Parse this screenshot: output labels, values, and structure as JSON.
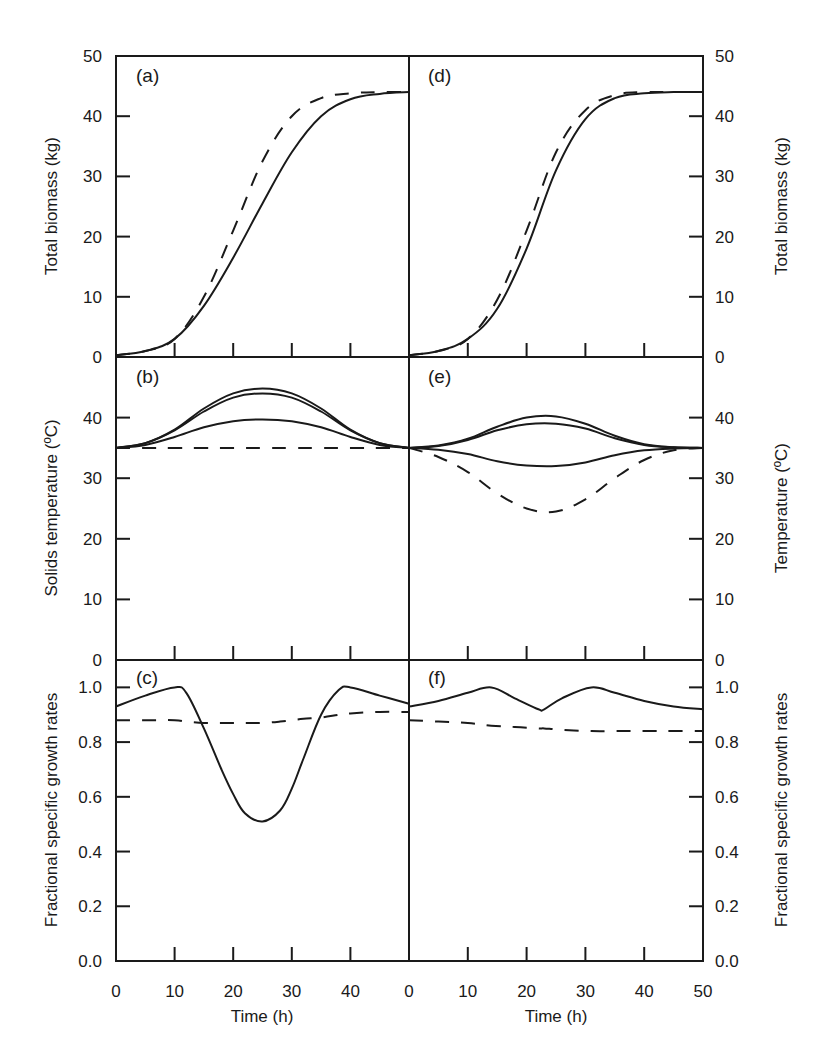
{
  "figure": {
    "x_axis_title": "Time (h)",
    "left_column": {
      "x_tick_labels": [
        "0",
        "10",
        "20",
        "30",
        "40"
      ]
    },
    "right_column": {
      "x_tick_labels": [
        "0",
        "10",
        "20",
        "30",
        "40",
        "50"
      ]
    }
  },
  "chart_data": [
    {
      "panel": "(a)",
      "type": "line",
      "ylabel": "Total biomass (kg)",
      "xlabel": "Time (h)",
      "xlim": [
        0,
        50
      ],
      "ylim": [
        0,
        50
      ],
      "yticks": [
        "0",
        "10",
        "20",
        "30",
        "40",
        "50"
      ],
      "x": [
        0,
        5,
        10,
        15,
        20,
        25,
        30,
        35,
        40,
        45,
        50
      ],
      "series": [
        {
          "name": "solid",
          "style": "solid",
          "values": [
            0.3,
            1.0,
            3.0,
            8.5,
            16.5,
            25.5,
            34.0,
            40.0,
            42.8,
            43.7,
            44.0
          ]
        },
        {
          "name": "dashed",
          "style": "dashed",
          "values": [
            0.3,
            1.0,
            3.0,
            10.0,
            21.0,
            32.5,
            40.0,
            43.0,
            43.8,
            44.0,
            44.0
          ]
        }
      ],
      "grid": false
    },
    {
      "panel": "(b)",
      "type": "line",
      "ylabel": "Solids temperature (ºC)",
      "xlabel": "Time (h)",
      "xlim": [
        0,
        50
      ],
      "ylim": [
        0,
        50
      ],
      "yticks": [
        "0",
        "10",
        "20",
        "30",
        "40"
      ],
      "x": [
        0,
        5,
        10,
        15,
        20,
        25,
        30,
        35,
        40,
        45,
        50
      ],
      "series": [
        {
          "name": "solid-upper",
          "style": "solid",
          "values": [
            35.0,
            35.8,
            38.0,
            41.5,
            44.0,
            44.8,
            44.0,
            41.5,
            38.0,
            35.8,
            35.0
          ]
        },
        {
          "name": "solid-middle",
          "style": "solid",
          "values": [
            35.0,
            35.8,
            37.9,
            41.0,
            43.3,
            44.0,
            43.3,
            41.0,
            37.9,
            35.8,
            35.0
          ]
        },
        {
          "name": "solid-lower",
          "style": "solid",
          "values": [
            35.0,
            35.5,
            36.8,
            38.4,
            39.4,
            39.7,
            39.4,
            38.4,
            36.8,
            35.5,
            35.0
          ]
        },
        {
          "name": "dashed",
          "style": "dashed",
          "values": [
            35.0,
            35.0,
            35.0,
            35.0,
            35.0,
            35.0,
            35.0,
            35.0,
            35.0,
            35.0,
            35.0
          ]
        }
      ],
      "grid": false
    },
    {
      "panel": "(c)",
      "type": "line",
      "ylabel": "Fractional specific growth rates",
      "xlabel": "Time (h)",
      "xlim": [
        0,
        50
      ],
      "ylim": [
        0.0,
        1.1
      ],
      "yticks": [
        "0.0",
        "0.2",
        "0.4",
        "0.6",
        "0.8",
        "1.0"
      ],
      "x": [
        0,
        5,
        10,
        12,
        15,
        18,
        20,
        22,
        25,
        28,
        30,
        32,
        35,
        38,
        40,
        45,
        50
      ],
      "series": [
        {
          "name": "solid",
          "style": "solid",
          "values": [
            0.93,
            0.97,
            1.0,
            0.98,
            0.85,
            0.7,
            0.61,
            0.54,
            0.51,
            0.55,
            0.63,
            0.74,
            0.9,
            0.99,
            1.0,
            0.97,
            0.94
          ]
        },
        {
          "name": "dashed",
          "style": "dashed",
          "values": [
            0.88,
            0.88,
            0.88,
            0.875,
            0.87,
            0.87,
            0.87,
            0.87,
            0.87,
            0.875,
            0.88,
            0.885,
            0.89,
            0.9,
            0.905,
            0.91,
            0.91
          ]
        }
      ],
      "grid": false
    },
    {
      "panel": "(d)",
      "type": "line",
      "ylabel": "Total biomass (kg)",
      "xlabel": "Time (h)",
      "xlim": [
        0,
        50
      ],
      "ylim": [
        0,
        50
      ],
      "yticks": [
        "0",
        "10",
        "20",
        "30",
        "40",
        "50"
      ],
      "x": [
        0,
        5,
        10,
        15,
        20,
        25,
        30,
        35,
        40,
        45,
        50
      ],
      "series": [
        {
          "name": "solid",
          "style": "solid",
          "values": [
            0.3,
            1.0,
            3.0,
            8.0,
            18.0,
            31.0,
            39.5,
            43.0,
            43.8,
            44.0,
            44.0
          ]
        },
        {
          "name": "dashed",
          "style": "dashed",
          "values": [
            0.3,
            1.0,
            3.0,
            9.5,
            21.0,
            34.0,
            41.0,
            43.5,
            44.0,
            44.0,
            44.0
          ]
        }
      ],
      "grid": false
    },
    {
      "panel": "(e)",
      "type": "line",
      "ylabel": "Temperature (ºC)",
      "xlabel": "Time (h)",
      "xlim": [
        0,
        50
      ],
      "ylim": [
        0,
        50
      ],
      "yticks": [
        "0",
        "10",
        "20",
        "30",
        "40"
      ],
      "x": [
        0,
        5,
        10,
        15,
        20,
        25,
        30,
        35,
        40,
        45,
        50
      ],
      "series": [
        {
          "name": "solid-upper",
          "style": "solid",
          "values": [
            35.0,
            35.4,
            36.5,
            38.5,
            40.0,
            40.2,
            39.0,
            37.0,
            35.6,
            35.1,
            35.0
          ]
        },
        {
          "name": "solid-middle",
          "style": "solid",
          "values": [
            35.0,
            35.3,
            36.3,
            37.9,
            38.9,
            39.0,
            38.2,
            36.6,
            35.5,
            35.1,
            35.0
          ]
        },
        {
          "name": "solid-lower",
          "style": "solid",
          "values": [
            35.0,
            34.7,
            34.0,
            32.8,
            32.1,
            32.0,
            32.6,
            33.8,
            34.6,
            34.9,
            35.0
          ]
        },
        {
          "name": "dashed",
          "style": "dashed",
          "values": [
            35.0,
            33.5,
            31.0,
            27.5,
            25.0,
            24.5,
            26.5,
            30.0,
            33.0,
            34.6,
            35.0
          ]
        }
      ],
      "grid": false
    },
    {
      "panel": "(f)",
      "type": "line",
      "ylabel": "Fractional specific growth rates",
      "xlabel": "Time (h)",
      "xlim": [
        0,
        50
      ],
      "ylim": [
        0.0,
        1.1
      ],
      "yticks": [
        "0.0",
        "0.2",
        "0.4",
        "0.6",
        "0.8",
        "1.0"
      ],
      "x": [
        0,
        5,
        10,
        14,
        18,
        22,
        23,
        26,
        31,
        35,
        40,
        45,
        50
      ],
      "series": [
        {
          "name": "solid",
          "style": "solid",
          "values": [
            0.93,
            0.95,
            0.98,
            1.0,
            0.96,
            0.92,
            0.92,
            0.96,
            1.0,
            0.98,
            0.95,
            0.93,
            0.92
          ]
        },
        {
          "name": "dashed",
          "style": "dashed",
          "values": [
            0.88,
            0.875,
            0.87,
            0.86,
            0.855,
            0.85,
            0.85,
            0.845,
            0.84,
            0.84,
            0.84,
            0.84,
            0.84
          ]
        }
      ],
      "grid": false
    }
  ]
}
